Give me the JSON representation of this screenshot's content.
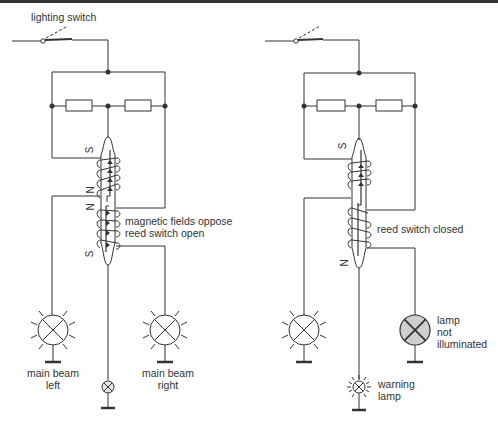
{
  "figure": {
    "type": "circuit-diagram"
  },
  "left_circuit": {
    "switch_label": "lighting switch",
    "pole_labels": [
      "S",
      "N",
      "N",
      "S"
    ],
    "annotation_line1": "magnetic fields oppose",
    "annotation_line2": "reed switch open",
    "lamp_left_line1": "main beam",
    "lamp_left_line2": "left",
    "lamp_right_line1": "main beam",
    "lamp_right_line2": "right",
    "state": "both lamps illuminated, warning lamp off"
  },
  "right_circuit": {
    "pole_labels": [
      "S",
      "N"
    ],
    "annotation": "reed switch closed",
    "lamp_right_line1": "lamp",
    "lamp_right_line2": "not",
    "lamp_right_line3": "illuminated",
    "warning_line1": "warning",
    "warning_line2": "lamp",
    "state": "right lamp failed, warning lamp on"
  },
  "colors": {
    "line": "#333333",
    "failed_lamp_fill": "#cfcfcf",
    "background": "#ffffff"
  }
}
